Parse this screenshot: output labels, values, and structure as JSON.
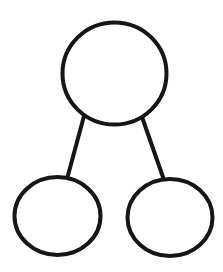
{
  "diagram": {
    "type": "tree",
    "canvas": {
      "width": 223,
      "height": 272,
      "background": "#ffffff"
    },
    "stroke": {
      "color": "#161616",
      "width": 4
    },
    "nodes": [
      {
        "id": "root",
        "label": "",
        "cx": 114.5,
        "cy": 73.5,
        "rx": 52,
        "ry": 51
      },
      {
        "id": "left-child",
        "label": "",
        "cx": 57.5,
        "cy": 216,
        "rx": 43,
        "ry": 39
      },
      {
        "id": "right-child",
        "label": "",
        "cx": 170,
        "cy": 217.5,
        "rx": 42.5,
        "ry": 38.5
      }
    ],
    "edges": [
      {
        "from": "root",
        "to": "left-child",
        "x1": 84,
        "y1": 116,
        "x2": 67,
        "y2": 179
      },
      {
        "from": "root",
        "to": "right-child",
        "x1": 142,
        "y1": 117,
        "x2": 164,
        "y2": 180
      }
    ]
  }
}
